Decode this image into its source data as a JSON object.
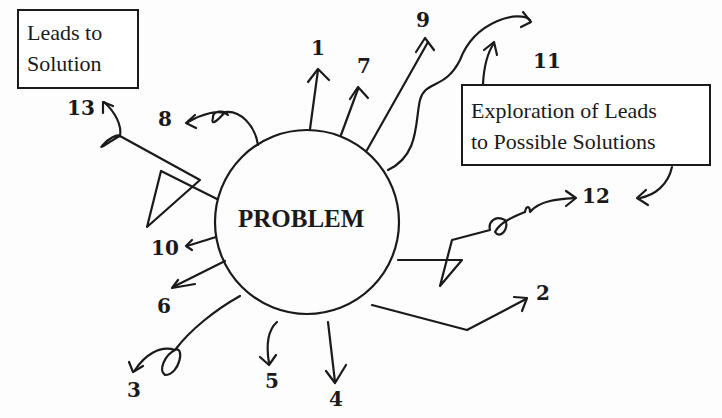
{
  "diagram": {
    "center": {
      "label": "PROBLEM"
    },
    "boxes": {
      "leads_to_solution": {
        "line1": "Leads to",
        "line2": "Solution"
      },
      "exploration": {
        "line1": "Exploration of Leads",
        "line2": "to Possible Solutions"
      }
    },
    "leads": [
      {
        "id": "1",
        "label": "1"
      },
      {
        "id": "2",
        "label": "2"
      },
      {
        "id": "3",
        "label": "3"
      },
      {
        "id": "4",
        "label": "4"
      },
      {
        "id": "5",
        "label": "5"
      },
      {
        "id": "6",
        "label": "6"
      },
      {
        "id": "7",
        "label": "7"
      },
      {
        "id": "8",
        "label": "8"
      },
      {
        "id": "9",
        "label": "9"
      },
      {
        "id": "10",
        "label": "10"
      },
      {
        "id": "11",
        "label": "11"
      },
      {
        "id": "12",
        "label": "12"
      },
      {
        "id": "13",
        "label": "13"
      }
    ],
    "colors": {
      "ink": "#1a1a1a",
      "background": "#fdfdfd"
    }
  }
}
